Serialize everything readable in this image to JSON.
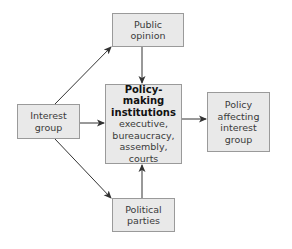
{
  "diagram": {
    "nodes": {
      "public_opinion": {
        "lines": [
          "Public",
          "opinion"
        ]
      },
      "interest_group": {
        "lines": [
          "Interest",
          "group"
        ]
      },
      "policy_institutions": {
        "title_lines": [
          "Policy-making",
          "institutions"
        ],
        "detail_lines": [
          "executive,",
          "bureaucracy,",
          "assembly,",
          "courts"
        ]
      },
      "policy_affecting": {
        "lines": [
          "Policy",
          "affecting",
          "interest",
          "group"
        ]
      },
      "political_parties": {
        "lines": [
          "Political",
          "parties"
        ]
      }
    },
    "edges": [
      {
        "from": "Interest group",
        "to": "Public opinion"
      },
      {
        "from": "Interest group",
        "to": "Policy-making institutions"
      },
      {
        "from": "Interest group",
        "to": "Political parties"
      },
      {
        "from": "Public opinion",
        "to": "Policy-making institutions"
      },
      {
        "from": "Political parties",
        "to": "Policy-making institutions"
      },
      {
        "from": "Policy-making institutions",
        "to": "Policy affecting interest group"
      }
    ],
    "colors": {
      "box_fill": "#e9e9e9",
      "box_border": "#9a9a9a",
      "arrow": "#333333",
      "text": "#3a3a3a"
    }
  }
}
